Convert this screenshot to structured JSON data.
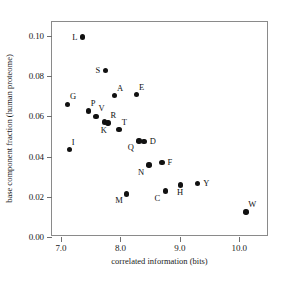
{
  "chart_data": {
    "type": "scatter",
    "title": "",
    "xlabel": "correlated information (bits)",
    "ylabel": "base component fraction (human proteome)",
    "xlim": [
      6.85,
      10.5
    ],
    "ylim": [
      0.0,
      0.107
    ],
    "xticks": [
      "7.0",
      "8.0",
      "9.0",
      "10.0"
    ],
    "xtick_values": [
      7.0,
      8.0,
      9.0,
      10.0
    ],
    "yticks": [
      "0.00",
      "0.02",
      "0.04",
      "0.06",
      "0.08",
      "0.10"
    ],
    "ytick_values": [
      0.0,
      0.02,
      0.04,
      0.06,
      0.08,
      0.1
    ],
    "grid": false,
    "legend": "none",
    "points": [
      {
        "label": "L",
        "x": 7.36,
        "y": 0.0995,
        "label_pos": "left"
      },
      {
        "label": "G",
        "x": 7.11,
        "y": 0.066,
        "label_pos": "upper-right"
      },
      {
        "label": "I",
        "x": 7.14,
        "y": 0.0435,
        "label_pos": "upper-right"
      },
      {
        "label": "P",
        "x": 7.46,
        "y": 0.0628,
        "label_pos": "upper-right"
      },
      {
        "label": "V",
        "x": 7.59,
        "y": 0.06,
        "label_pos": "upper-right"
      },
      {
        "label": "K",
        "x": 7.73,
        "y": 0.0572,
        "label_pos": "below"
      },
      {
        "label": "R",
        "x": 7.79,
        "y": 0.0568,
        "label_pos": "upper-right"
      },
      {
        "label": "S",
        "x": 7.75,
        "y": 0.0828,
        "label_pos": "left"
      },
      {
        "label": "A",
        "x": 7.9,
        "y": 0.0703,
        "label_pos": "upper-right"
      },
      {
        "label": "T",
        "x": 7.98,
        "y": 0.0535,
        "label_pos": "upper-right"
      },
      {
        "label": "E",
        "x": 8.27,
        "y": 0.0708,
        "label_pos": "upper-right"
      },
      {
        "label": "M",
        "x": 8.1,
        "y": 0.0215,
        "label_pos": "lower-left"
      },
      {
        "label": "Q",
        "x": 8.31,
        "y": 0.0478,
        "label_pos": "lower-left"
      },
      {
        "label": "D",
        "x": 8.4,
        "y": 0.0474,
        "label_pos": "right"
      },
      {
        "label": "N",
        "x": 8.48,
        "y": 0.0358,
        "label_pos": "lower-left"
      },
      {
        "label": "F",
        "x": 8.7,
        "y": 0.037,
        "label_pos": "right"
      },
      {
        "label": "C",
        "x": 8.76,
        "y": 0.0228,
        "label_pos": "lower-left"
      },
      {
        "label": "H",
        "x": 9.01,
        "y": 0.0259,
        "label_pos": "below"
      },
      {
        "label": "Y",
        "x": 9.3,
        "y": 0.0265,
        "label_pos": "right"
      },
      {
        "label": "W",
        "x": 10.11,
        "y": 0.0124,
        "label_pos": "upper-right"
      }
    ]
  },
  "style": {
    "point_color": "#111111",
    "frame_color": "#8a8a8a",
    "text_color": "#1a1a1a",
    "background": "#ffffff"
  }
}
